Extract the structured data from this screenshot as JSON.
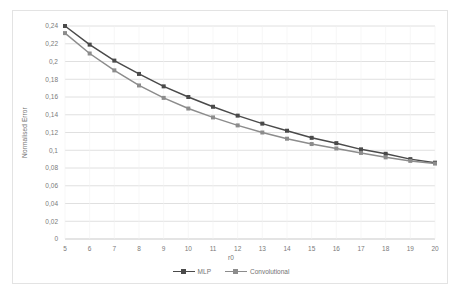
{
  "chart_data": {
    "type": "line",
    "title": "",
    "xlabel": "r0",
    "ylabel": "Normalised Error",
    "x": [
      5,
      6,
      7,
      8,
      9,
      10,
      11,
      12,
      13,
      14,
      15,
      16,
      17,
      18,
      19,
      20
    ],
    "xtick_labels": [
      "5",
      "6",
      "7",
      "8",
      "9",
      "10",
      "11",
      "12",
      "13",
      "14",
      "15",
      "16",
      "17",
      "18",
      "19",
      "20"
    ],
    "ytick_labels": [
      "0",
      "0,02",
      "0,04",
      "0,06",
      "0,08",
      "0,1",
      "0,12",
      "0,14",
      "0,16",
      "0,18",
      "0,2",
      "0,22",
      "0,24"
    ],
    "ytick_values": [
      0,
      0.02,
      0.04,
      0.06,
      0.08,
      0.1,
      0.12,
      0.14,
      0.16,
      0.18,
      0.2,
      0.22,
      0.24
    ],
    "ylim": [
      0,
      0.24
    ],
    "xlim": [
      5,
      20
    ],
    "grid": "horizontal",
    "legend_position": "bottom",
    "marker": "square",
    "series": [
      {
        "name": "MLP",
        "color": "#4a4a4a",
        "values": [
          0.24,
          0.219,
          0.201,
          0.186,
          0.172,
          0.16,
          0.149,
          0.139,
          0.13,
          0.122,
          0.114,
          0.108,
          0.101,
          0.096,
          0.09,
          0.086
        ]
      },
      {
        "name": "Convolutional",
        "color": "#8c8c8c",
        "values": [
          0.232,
          0.209,
          0.19,
          0.173,
          0.159,
          0.147,
          0.137,
          0.128,
          0.12,
          0.113,
          0.107,
          0.102,
          0.097,
          0.092,
          0.088,
          0.085
        ]
      }
    ]
  },
  "axes": {
    "x_title": "r0",
    "y_title": "Normalised Error"
  },
  "legend": {
    "items": [
      {
        "label": "MLP",
        "color": "#4a4a4a"
      },
      {
        "label": "Convolutional",
        "color": "#8c8c8c"
      }
    ]
  }
}
